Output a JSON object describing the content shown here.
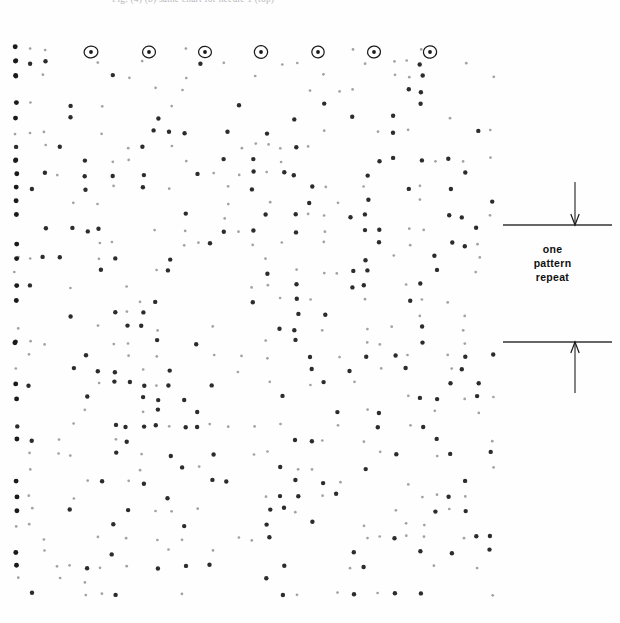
{
  "page": {
    "background_color": "#ffffff",
    "ink_color": "#1a1a1a"
  },
  "caption": {
    "text": "Fig. (4)  (b) same chart for needle 1 (top)"
  },
  "annotation": {
    "label_line_1": "one",
    "label_line_2": "pattern",
    "label_line_3": "repeat",
    "rule_color": "#333333",
    "arrow_color": "#1a1a1a",
    "top_rule_y": 45,
    "bottom_rule_y": 162,
    "arrow_x": 75,
    "rule_x_start": 3,
    "rule_x_end": 112
  },
  "chart_data": {
    "type": "scatter",
    "title": "one pattern repeat",
    "xlabel": "",
    "ylabel": "",
    "grid": false,
    "legend": null,
    "xlim": [
      0,
      492
    ],
    "ylim": [
      0,
      572
    ],
    "marker_color": "#1a1a1a",
    "marker_size": 2.2,
    "ring_row_y": 22,
    "ring_radius": 6.5,
    "ringed_points_x": [
      79,
      137,
      193,
      249,
      306,
      362,
      418
    ],
    "ringed_points": [
      {
        "x": 79,
        "y": 22
      },
      {
        "x": 137,
        "y": 22
      },
      {
        "x": 193,
        "y": 22
      },
      {
        "x": 249,
        "y": 22
      },
      {
        "x": 306,
        "y": 22
      },
      {
        "x": 362,
        "y": 22
      },
      {
        "x": 418,
        "y": 22
      }
    ],
    "column_spacing": 14,
    "row_spacing": 14,
    "columns": 35,
    "rows": 41,
    "seed": 20240617
  }
}
